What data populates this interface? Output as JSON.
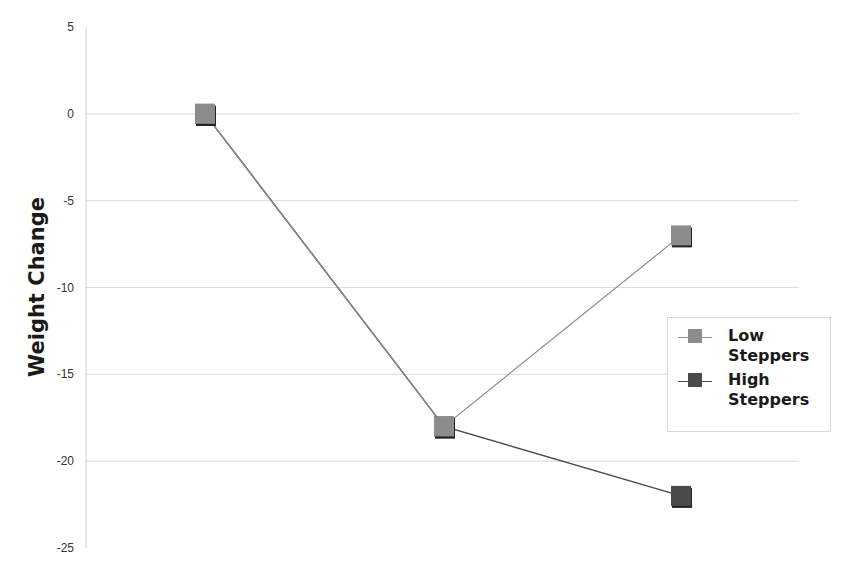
{
  "chart_data": {
    "type": "line",
    "title": "",
    "xlabel": "",
    "ylabel": "Weight Change",
    "categories": [
      "1",
      "2",
      "3"
    ],
    "series": [
      {
        "name": "Low Steppers",
        "values": [
          0,
          -18,
          -7
        ],
        "color": "#8c8c8c"
      },
      {
        "name": "High Steppers",
        "values": [
          0,
          -18,
          -22
        ],
        "color": "#4a4a4a"
      }
    ],
    "ylim": [
      -25,
      5
    ],
    "yticks": [
      5,
      0,
      -5,
      -10,
      -15,
      -20,
      -25
    ],
    "grid": true,
    "legend_position": "right"
  },
  "axis": {
    "y_title": "Weight Change",
    "y_tick_labels": [
      "5",
      "0",
      "-5",
      "-10",
      "-15",
      "-20",
      "-25"
    ]
  },
  "legend": {
    "items": [
      {
        "label": "Low Steppers",
        "color": "#8c8c8c"
      },
      {
        "label": "High Steppers",
        "color": "#4a4a4a"
      }
    ]
  }
}
